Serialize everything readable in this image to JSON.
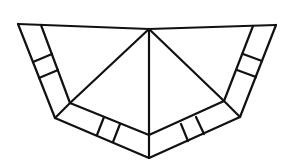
{
  "figure": {
    "stroke_color": "#111111",
    "background": "#ffffff"
  },
  "shapes": {
    "outer_outline": [
      [
        18,
        24
      ],
      [
        55,
        118
      ],
      [
        149,
        158
      ],
      [
        240,
        117
      ],
      [
        276,
        25
      ]
    ],
    "top_edge": [
      [
        18,
        24
      ],
      [
        149,
        29
      ],
      [
        276,
        25
      ]
    ],
    "inner_outline": [
      [
        41,
        25
      ],
      [
        70,
        103
      ],
      [
        149,
        135
      ],
      [
        224,
        101
      ],
      [
        253,
        26
      ]
    ],
    "apex_lines": [
      [
        [
          149,
          29
        ],
        [
          70,
          103
        ]
      ],
      [
        [
          149,
          29
        ],
        [
          149,
          158
        ]
      ],
      [
        [
          149,
          29
        ],
        [
          224,
          101
        ]
      ]
    ],
    "corner_joins": [
      [
        [
          70,
          103
        ],
        [
          55,
          118
        ]
      ],
      [
        [
          224,
          101
        ],
        [
          240,
          117
        ]
      ]
    ],
    "crossbars": [
      [
        [
          33,
          62
        ],
        [
          52,
          54
        ]
      ],
      [
        [
          39,
          78
        ],
        [
          58,
          70
        ]
      ],
      [
        [
          104,
          117
        ],
        [
          97,
          135
        ]
      ],
      [
        [
          120,
          124
        ],
        [
          113,
          142
        ]
      ],
      [
        [
          181,
          124
        ],
        [
          188,
          141
        ]
      ],
      [
        [
          196,
          117
        ],
        [
          204,
          134
        ]
      ],
      [
        [
          243,
          54
        ],
        [
          262,
          61
        ]
      ],
      [
        [
          237,
          70
        ],
        [
          256,
          77
        ]
      ]
    ]
  }
}
